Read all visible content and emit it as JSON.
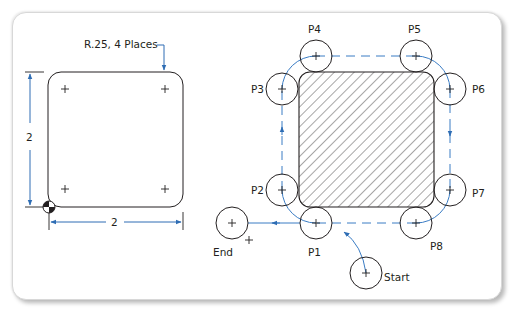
{
  "figure": {
    "type": "CNC tool path diagram",
    "left_view": {
      "callout": "R.25, 4 Places",
      "dim_vertical": "2",
      "dim_horizontal": "2"
    },
    "right_view": {
      "points": [
        {
          "id": "P1",
          "label": "P1"
        },
        {
          "id": "P2",
          "label": "P2"
        },
        {
          "id": "P3",
          "label": "P3"
        },
        {
          "id": "P4",
          "label": "P4"
        },
        {
          "id": "P5",
          "label": "P5"
        },
        {
          "id": "P6",
          "label": "P6"
        },
        {
          "id": "P7",
          "label": "P7"
        },
        {
          "id": "P8",
          "label": "P8"
        }
      ],
      "start_label": "Start",
      "end_label": "End"
    },
    "colors": {
      "line": "#231f20",
      "dimension": "#2e6db4",
      "toolpath": "#3a7cc4",
      "frame_border": "#d8d8d8"
    }
  }
}
